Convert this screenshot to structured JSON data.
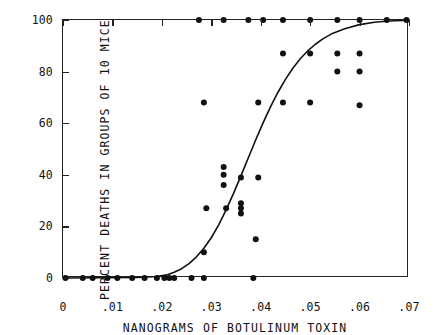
{
  "chart_data": {
    "type": "scatter",
    "title": "",
    "xlabel": "NANOGRAMS OF BOTULINUM TOXIN",
    "ylabel": "PERCENT DEATHS IN GROUPS OF 10 MICE",
    "xlim": [
      0,
      0.07
    ],
    "ylim": [
      0,
      100
    ],
    "xticks": [
      0,
      0.01,
      0.02,
      0.03,
      0.04,
      0.05,
      0.06,
      0.07
    ],
    "xticklabels": [
      "0",
      ".01",
      ".02",
      ".03",
      ".04",
      ".05",
      ".06",
      ".07"
    ],
    "yticks": [
      0,
      20,
      40,
      60,
      80,
      100
    ],
    "yticklabels": [
      "0",
      "20",
      "40",
      "60",
      "80",
      "100"
    ],
    "grid": false,
    "legend": null,
    "series": [
      {
        "name": "observed mortality",
        "marker": "filled-circle",
        "marker_color": "#111111",
        "marker_size": 3.0,
        "points": [
          [
            0.0005,
            0
          ],
          [
            0.004,
            0
          ],
          [
            0.006,
            0
          ],
          [
            0.009,
            0
          ],
          [
            0.011,
            0
          ],
          [
            0.014,
            0
          ],
          [
            0.0165,
            0
          ],
          [
            0.019,
            0
          ],
          [
            0.0205,
            0
          ],
          [
            0.0215,
            0
          ],
          [
            0.0225,
            0
          ],
          [
            0.026,
            0
          ],
          [
            0.0285,
            0
          ],
          [
            0.0385,
            0
          ],
          [
            0.0285,
            10
          ],
          [
            0.039,
            15
          ],
          [
            0.029,
            27
          ],
          [
            0.033,
            27
          ],
          [
            0.036,
            25
          ],
          [
            0.036,
            27
          ],
          [
            0.036,
            29
          ],
          [
            0.0325,
            36
          ],
          [
            0.0325,
            40
          ],
          [
            0.0325,
            43
          ],
          [
            0.036,
            39
          ],
          [
            0.0395,
            39
          ],
          [
            0.0285,
            68
          ],
          [
            0.0395,
            68
          ],
          [
            0.0445,
            68
          ],
          [
            0.05,
            68
          ],
          [
            0.06,
            67
          ],
          [
            0.0555,
            80
          ],
          [
            0.06,
            80
          ],
          [
            0.0445,
            87
          ],
          [
            0.05,
            87
          ],
          [
            0.0555,
            87
          ],
          [
            0.06,
            87
          ],
          [
            0.0275,
            100
          ],
          [
            0.0325,
            100
          ],
          [
            0.0375,
            100
          ],
          [
            0.0405,
            100
          ],
          [
            0.0445,
            100
          ],
          [
            0.05,
            100
          ],
          [
            0.0555,
            100
          ],
          [
            0.06,
            100
          ],
          [
            0.0655,
            100
          ],
          [
            0.0695,
            100
          ]
        ]
      }
    ],
    "fit_curve": {
      "name": "fitted dose-response (sigmoid)",
      "color": "#111111",
      "line_width": 1.6,
      "x": [
        0.0,
        0.015,
        0.019,
        0.021,
        0.0225,
        0.024,
        0.0255,
        0.027,
        0.0285,
        0.03,
        0.0315,
        0.033,
        0.0345,
        0.036,
        0.0375,
        0.039,
        0.0405,
        0.042,
        0.0435,
        0.045,
        0.0465,
        0.048,
        0.0495,
        0.051,
        0.0525,
        0.0545,
        0.057,
        0.06,
        0.063,
        0.066,
        0.07
      ],
      "y": [
        0.0,
        0.2,
        0.6,
        1.2,
        2.2,
        3.6,
        5.6,
        8.2,
        11.5,
        15.6,
        20.6,
        26.4,
        32.8,
        39.6,
        46.6,
        53.6,
        60.2,
        66.4,
        72.0,
        77.0,
        81.3,
        85.0,
        88.0,
        90.5,
        92.6,
        94.8,
        96.6,
        98.2,
        99.1,
        99.6,
        99.9
      ]
    }
  }
}
